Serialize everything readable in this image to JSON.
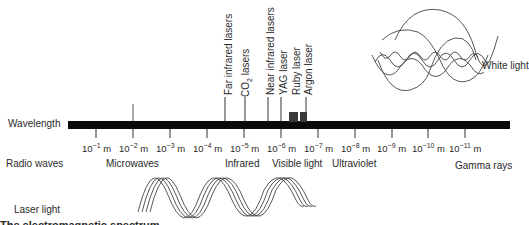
{
  "axis": {
    "label": "Wavelength",
    "ticks": [
      {
        "base": "10",
        "exp": "−1",
        "unit": "m"
      },
      {
        "base": "10",
        "exp": "−2",
        "unit": "m"
      },
      {
        "base": "10",
        "exp": "−3",
        "unit": "m"
      },
      {
        "base": "10",
        "exp": "−4",
        "unit": "m"
      },
      {
        "base": "10",
        "exp": "−5",
        "unit": "m"
      },
      {
        "base": "10",
        "exp": "−6",
        "unit": "m"
      },
      {
        "base": "10",
        "exp": "−7",
        "unit": "m"
      },
      {
        "base": "10",
        "exp": "−8",
        "unit": "m"
      },
      {
        "base": "10",
        "exp": "−9",
        "unit": "m"
      },
      {
        "base": "10",
        "exp": "−10",
        "unit": "m"
      },
      {
        "base": "10",
        "exp": "−11",
        "unit": "m"
      }
    ]
  },
  "bands": {
    "radio": "Radio waves",
    "microwaves": "Microwaves",
    "infrared": "Infrared",
    "visible": "Visible light",
    "ultraviolet": "Ultraviolet",
    "gamma": "Gamma rays"
  },
  "lasers": {
    "far_ir": "Far infrared lasers",
    "co2_prefix": "CO",
    "co2_sub": "2",
    "co2_suffix": " lasers",
    "near_ir": "Near infrared lasers",
    "yag": "YAG laser",
    "ruby": "Ruby laser",
    "argon": "Argon laser"
  },
  "illustrations": {
    "white_light": "White light",
    "laser_light": "Laser light"
  },
  "cropped_caption": "The electromagnetic spectrum"
}
